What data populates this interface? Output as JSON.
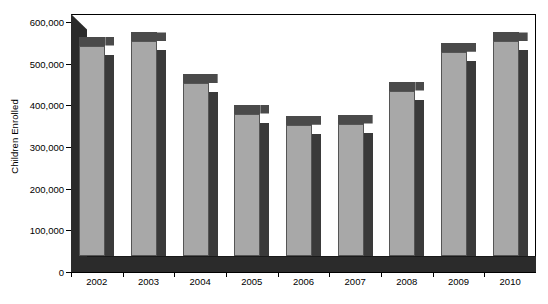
{
  "chart_data": {
    "type": "bar",
    "title": "",
    "xlabel": "",
    "ylabel": "Children Enrolled",
    "categories": [
      "2002",
      "2003",
      "2004",
      "2005",
      "2006",
      "2007",
      "2008",
      "2009",
      "2010"
    ],
    "values": [
      505000,
      515000,
      415000,
      342000,
      315000,
      318000,
      397000,
      490000,
      515000
    ],
    "ylim": [
      0,
      600000
    ],
    "ytick_values": [
      0,
      100000,
      200000,
      300000,
      400000,
      500000,
      600000
    ],
    "ytick_labels": [
      "0",
      "100,000",
      "200,000",
      "300,000",
      "400,000",
      "500,000",
      "600,000"
    ],
    "grid": false,
    "legend": null,
    "style": "3d-column",
    "colors": {
      "bar_face": "#a8a8a8",
      "bar_side": "#3a3a3a",
      "bar_top": "#4a4a4a",
      "wall": "#2b2b2b",
      "axis": "#000000",
      "background": "#ffffff"
    }
  }
}
